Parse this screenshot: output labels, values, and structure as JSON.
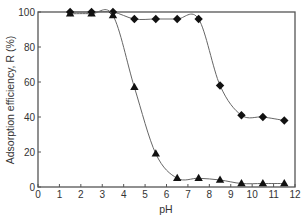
{
  "chart_data": {
    "type": "line",
    "title": "",
    "xlabel": "pH",
    "ylabel": "Adsorption efficiency, R (%)",
    "xlim": [
      0,
      12
    ],
    "ylim": [
      0,
      100
    ],
    "xticks": [
      0,
      1,
      2,
      3,
      4,
      5,
      6,
      7,
      8,
      9,
      10,
      11,
      12
    ],
    "yticks": [
      0,
      20,
      40,
      60,
      80,
      100
    ],
    "grid": false,
    "legend": null,
    "series": [
      {
        "name": "diamond-series",
        "marker": "diamond",
        "x": [
          1.5,
          2.5,
          3.5,
          4.5,
          5.5,
          6.5,
          7.5,
          8.5,
          9.5,
          10.5,
          11.5
        ],
        "values": [
          100,
          100,
          100,
          96,
          96,
          96,
          96,
          58,
          41,
          40,
          38
        ]
      },
      {
        "name": "triangle-series",
        "marker": "triangle",
        "x": [
          1.5,
          2.5,
          3.5,
          4.5,
          5.5,
          6.5,
          7.5,
          8.5,
          9.5,
          10.5,
          11.5
        ],
        "values": [
          99,
          99,
          98,
          57,
          19,
          5,
          5,
          4,
          2,
          2,
          2
        ]
      }
    ]
  },
  "colors": {
    "axis": "#555555",
    "line": "#666666",
    "marker": "#111111",
    "text": "#333333"
  }
}
